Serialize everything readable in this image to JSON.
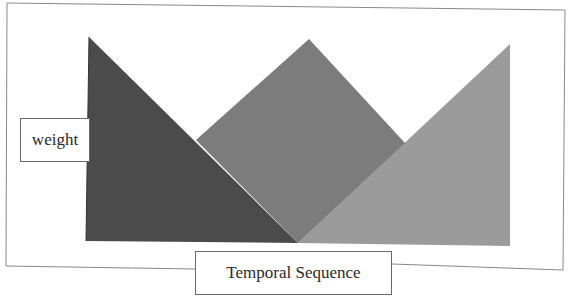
{
  "diagram": {
    "type": "triangular-membership-weights",
    "ylabel": "weight",
    "xlabel": "Temporal Sequence",
    "shapes": [
      {
        "name": "left-triangle",
        "color": "#4a4a4a",
        "points": [
          [
            89,
            37
          ],
          [
            86,
            241
          ],
          [
            298,
            242
          ]
        ]
      },
      {
        "name": "middle-triangle",
        "color": "#7a7a7a",
        "points": [
          [
            196,
            140
          ],
          [
            309,
            39
          ],
          [
            405,
            143
          ],
          [
            298,
            242
          ]
        ]
      },
      {
        "name": "right-triangle",
        "color": "#9a9a9a",
        "points": [
          [
            298,
            242
          ],
          [
            510,
            44
          ],
          [
            510,
            246
          ]
        ]
      }
    ],
    "frame": {
      "points": [
        [
          6,
          3
        ],
        [
          565,
          10
        ],
        [
          565,
          270
        ],
        [
          6,
          268
        ]
      ],
      "color": "#808080"
    }
  }
}
